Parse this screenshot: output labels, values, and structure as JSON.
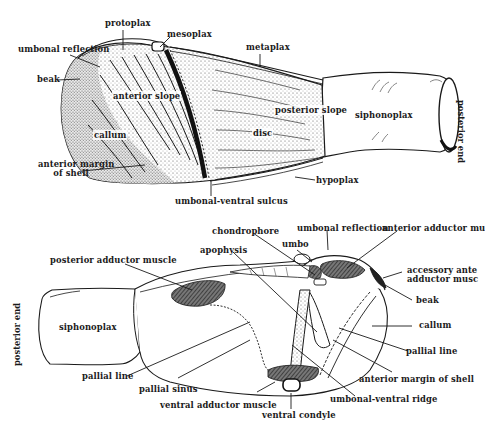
{
  "figure": {
    "top_view": {
      "name": "external shell view",
      "labels": {
        "protoplax": "protoplax",
        "mesoplax": "mesoplax",
        "umbonal_reflection": "umbonal reflection",
        "metaplax": "metaplax",
        "beak": "beak",
        "anterior_slope": "anterior slope",
        "posterior_slope": "posterior slope",
        "siphonoplax": "siphonoplax",
        "callum": "callum",
        "disc": "disc",
        "anterior_margin_line1": "anterior margin",
        "anterior_margin_line2": "of shell",
        "hypoplax": "hypoplax",
        "umbonal_ventral_sulcus": "umbonal-ventral sulcus",
        "posterior_end": "posterior end"
      }
    },
    "bottom_view": {
      "name": "internal shell view",
      "labels": {
        "chondrophore": "chondrophore",
        "umbonal_reflection": "umbonal reflection",
        "anterior_adductor_muscle": "anterior adductor mu",
        "umbo": "umbo",
        "apophysis": "apophysis",
        "posterior_adductor_muscle": "posterior adductor muscle",
        "accessory_line1": "accessory ante",
        "accessory_line2": "adductor musc",
        "beak": "beak",
        "callum": "callum",
        "posterior_end": "posterior end",
        "siphonoplax": "siphonoplax",
        "pallial_line_left": "pallial line",
        "pallial_line_right": "pallial line",
        "pallial_sinus": "pallial sinus",
        "anterior_margin_of_shell": "anterior margin of shell",
        "ventral_adductor_muscle": "ventral adductor muscle",
        "umbonal_ventral_ridge": "umbonal-ventral ridge",
        "ventral_condyle": "ventral condyle"
      }
    }
  },
  "colors": {
    "ink": "#1a1a1a",
    "stipple": "#6a6a6a",
    "muscle_fill": "#5a5a5a",
    "background": "#ffffff"
  }
}
